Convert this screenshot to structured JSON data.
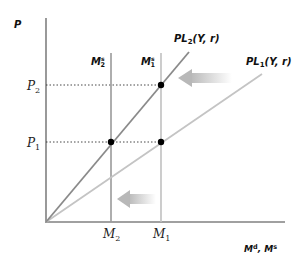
{
  "diagram": {
    "type": "economics-money-market",
    "axes": {
      "y_label": "P",
      "x_label_main": "M",
      "x_label_sup1": "d",
      "x_label_sep": ", ",
      "x_label_main2": "M",
      "x_label_sup2": "s"
    },
    "ticks": {
      "p2": {
        "base": "P",
        "sub": "2"
      },
      "p1": {
        "base": "P",
        "sub": "1"
      },
      "m2": {
        "base": "M",
        "sub": "2"
      },
      "m1": {
        "base": "M",
        "sub": "1"
      }
    },
    "supply_lines": {
      "m2s": {
        "base": "M",
        "sub": "2",
        "sup": "s"
      },
      "m1s": {
        "base": "M",
        "sub": "1",
        "sup": "s"
      }
    },
    "demand_curves": {
      "pl2": {
        "base": "PL",
        "sub": "2",
        "args": "(Y, r)"
      },
      "pl1": {
        "base": "PL",
        "sub": "1",
        "args": "(Y, r)"
      }
    },
    "points": [
      {
        "name": "M1-P2",
        "x": "M1",
        "y": "P2"
      },
      {
        "name": "M2-P1",
        "x": "M2",
        "y": "P1"
      },
      {
        "name": "M1-P1",
        "x": "M1",
        "y": "P1"
      }
    ],
    "arrows": [
      {
        "name": "demand-shift-arrow",
        "direction": "left"
      },
      {
        "name": "supply-shift-arrow",
        "direction": "left"
      }
    ],
    "colors": {
      "axis": "#808080",
      "pl2": "#8a8a8a",
      "pl1": "#c4c4c4",
      "m2s": "#9a9a9a",
      "m1s": "#c0c0c0",
      "dot": "#000000",
      "arrow": "#c8c8c8"
    }
  }
}
